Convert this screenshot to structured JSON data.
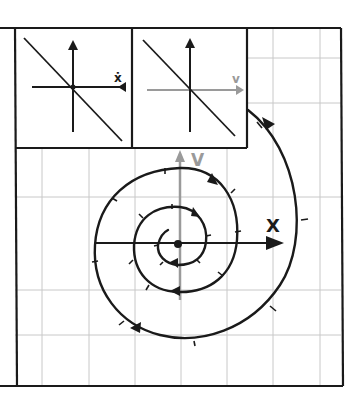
{
  "figure": {
    "type": "phase-portrait",
    "colors": {
      "ink": "#1a1a1a",
      "axis_gray": "#9a9a9a",
      "grid": "#c8c8c8",
      "background": "#ffffff"
    }
  },
  "inset_left": {
    "horizontal_axis_label": "ẋ",
    "vertical_axis_label": "",
    "line": "decreasing diagonal through origin"
  },
  "inset_right": {
    "horizontal_axis_label": "v",
    "vertical_axis_label": "",
    "line": "decreasing diagonal through origin"
  },
  "main_plot": {
    "x_axis_label": "X",
    "y_axis_label": "V",
    "origin_marker": "filled dot",
    "trajectory": "clockwise inward spiral with arrowheads and tick marks"
  }
}
